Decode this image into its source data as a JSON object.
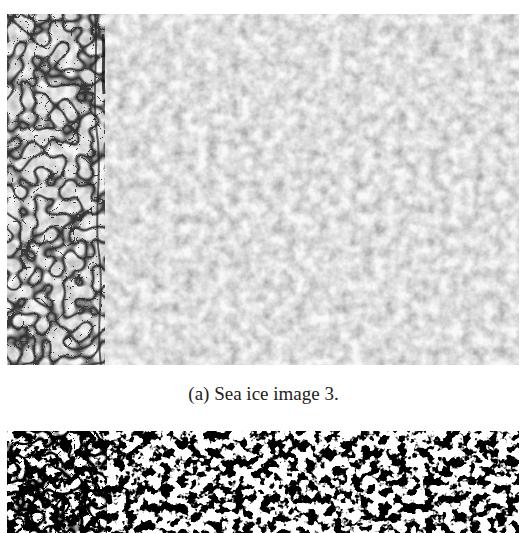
{
  "figure": {
    "subfigures": [
      {
        "label": "(a)",
        "caption": "(a)  Sea ice image 3.",
        "image": "grayscale-sea-ice-photo",
        "description": "Aerial grayscale image of sea ice floes; dense polygonal floes with dark cracks on the left, fine brash ice texture to the right"
      },
      {
        "label": "(b)",
        "caption": "",
        "image": "binary-segmented-sea-ice",
        "description": "Black-and-white thresholded segmentation of sea ice image (partially visible)"
      }
    ]
  },
  "colors": {
    "background": "#ffffff",
    "ice_light": "#e6e6e6",
    "ice_mid": "#b5b5b5",
    "crack": "#1a1a1a"
  }
}
